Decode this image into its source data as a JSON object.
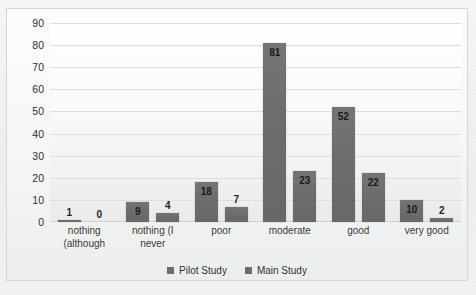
{
  "chart_data": {
    "type": "bar",
    "title": "",
    "xlabel": "",
    "ylabel": "",
    "ylim": [
      0,
      90
    ],
    "yticks": [
      90,
      80,
      70,
      60,
      50,
      40,
      30,
      20,
      10,
      0
    ],
    "grid": true,
    "legend_position": "bottom",
    "categories": [
      "nothing (although",
      "nothing (I never",
      "poor",
      "moderate",
      "good",
      "very good"
    ],
    "category_lines": [
      [
        "nothing",
        "(although"
      ],
      [
        "nothing (I",
        "never"
      ],
      [
        "poor"
      ],
      [
        "moderate"
      ],
      [
        "good"
      ],
      [
        "very good"
      ]
    ],
    "series": [
      {
        "name": "Pilot Study",
        "color": "#6d6d6d",
        "values": [
          1,
          9,
          18,
          81,
          52,
          10
        ]
      },
      {
        "name": "Main Study",
        "color": "#6d6d6d",
        "values": [
          0,
          4,
          7,
          23,
          22,
          2
        ]
      }
    ]
  },
  "legend": {
    "items": [
      {
        "label": "Pilot Study"
      },
      {
        "label": "Main Study"
      }
    ]
  },
  "ghost_text": {
    "line1": "",
    "line2": ""
  }
}
